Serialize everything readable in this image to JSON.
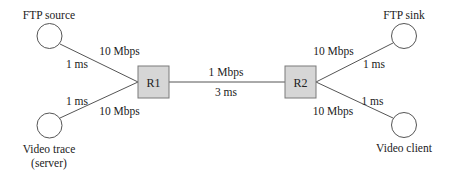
{
  "diagram": {
    "type": "network-topology",
    "colors": {
      "line": "#555555",
      "router_fill": "#d6d6d6",
      "router_border": "#7a7a7a",
      "host_fill": "#ffffff",
      "text": "#222222"
    },
    "nodes": {
      "ftp_source": {
        "label": "FTP source",
        "kind": "host"
      },
      "video_trace": {
        "label_line1": "Video trace",
        "label_line2": "(server)",
        "kind": "host"
      },
      "r1": {
        "label": "R1",
        "kind": "router"
      },
      "r2": {
        "label": "R2",
        "kind": "router"
      },
      "ftp_sink": {
        "label": "FTP sink",
        "kind": "host"
      },
      "video_client": {
        "label": "Video client",
        "kind": "host"
      }
    },
    "links": {
      "ftp_source_r1": {
        "bandwidth": "10 Mbps",
        "delay": "1 ms"
      },
      "video_trace_r1": {
        "bandwidth": "10 Mbps",
        "delay": "1 ms"
      },
      "r1_r2": {
        "bandwidth": "1 Mbps",
        "delay": "3 ms"
      },
      "r2_ftp_sink": {
        "bandwidth": "10 Mbps",
        "delay": "1 ms"
      },
      "r2_video_client": {
        "bandwidth": "10 Mbps",
        "delay": "1 ms"
      }
    }
  }
}
